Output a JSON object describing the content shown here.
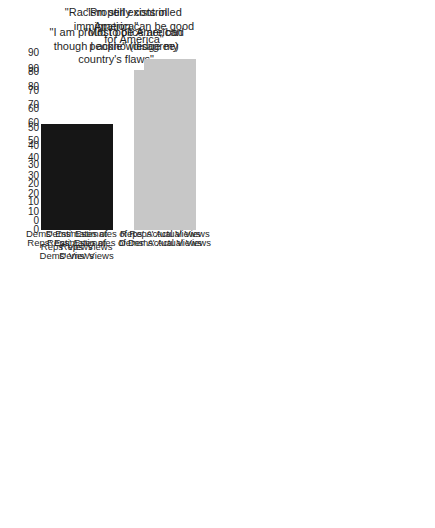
{
  "figure": {
    "background": "#ffffff",
    "text_color": "#1f1f1f"
  },
  "chart_data": [
    {
      "type": "bar",
      "panel": "top-left",
      "title": "\"Most police are bad people\" (disagree)",
      "title_lines": [
        "\"Most police are bad",
        "people\" (disagree)"
      ],
      "categories": [
        "Reps' Estimates of\nDems' Views",
        "Dems' Actual Views"
      ],
      "values": [
        48,
        85
      ],
      "bar_colors": [
        "#161616",
        "#c7c7c7"
      ],
      "yticks": [
        90,
        80,
        70,
        60,
        50,
        40,
        30,
        20,
        10,
        0
      ],
      "ylim": [
        0,
        95
      ],
      "show_yaxis": true,
      "xlabel": "",
      "ylabel": "",
      "grid": false,
      "legend": "none"
    },
    {
      "type": "bar",
      "panel": "top-right",
      "title": "\"I am proud to be American though I acknowledge my country's flaws\"",
      "title_lines": [
        "\"I am proud to be American",
        "though I acknowledge my",
        "country's flaws\""
      ],
      "categories": [
        "Reps' Estimates of\nDems' Views",
        "Dems' Actual Views"
      ],
      "values": [
        51,
        72
      ],
      "bar_colors": [
        "#161616",
        "#c7c7c7"
      ],
      "yticks": [
        90,
        80,
        70,
        60,
        50,
        40,
        30,
        20,
        10,
        0
      ],
      "ylim": [
        0,
        95
      ],
      "show_yaxis": false,
      "xlabel": "",
      "ylabel": "",
      "grid": false,
      "legend": "none"
    },
    {
      "type": "bar",
      "panel": "bottom-left",
      "title": "\"Properly controlled immigration can be good for America\"",
      "title_lines": [
        "\"Properly controlled",
        "immigration can be good",
        "for America\""
      ],
      "categories": [
        "Dems' Estimates of\nReps' Views",
        "Reps' Actual Views"
      ],
      "values": [
        52,
        87
      ],
      "bar_colors": [
        "#161616",
        "#c7c7c7"
      ],
      "yticks": [
        90,
        80,
        70,
        60,
        50,
        40,
        30,
        20,
        10,
        0
      ],
      "ylim": [
        0,
        95
      ],
      "show_yaxis": true,
      "xlabel": "",
      "ylabel": "",
      "grid": false,
      "legend": "none"
    },
    {
      "type": "bar",
      "panel": "bottom-right",
      "title": "\"Racism still exists in America\"",
      "title_lines": [
        "\"Racism still exists in",
        "America\""
      ],
      "categories": [
        "Dems' Estimates of\nReps' Views",
        "Reps' Actual Views"
      ],
      "values": [
        52,
        81
      ],
      "bar_colors": [
        "#161616",
        "#c7c7c7"
      ],
      "yticks": [
        90,
        80,
        70,
        60,
        50,
        40,
        30,
        20,
        10,
        0
      ],
      "ylim": [
        0,
        95
      ],
      "show_yaxis": false,
      "xlabel": "",
      "ylabel": "",
      "grid": false,
      "legend": "none"
    }
  ]
}
